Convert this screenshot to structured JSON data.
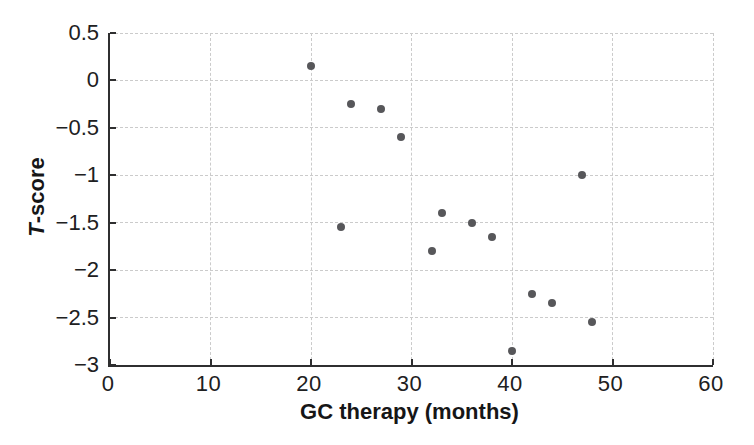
{
  "chart_data": {
    "type": "scatter",
    "title": "",
    "xlabel": "GC therapy (months)",
    "ylabel": "T-score",
    "ylabel_italic": "T",
    "ylabel_rest": "-score",
    "xlim": [
      0,
      60
    ],
    "ylim": [
      -3,
      0.5
    ],
    "grid": true,
    "gridline_style": "dashed",
    "xticks": [
      {
        "label": "0",
        "value": 0
      },
      {
        "label": "10",
        "value": 10
      },
      {
        "label": "20",
        "value": 20
      },
      {
        "label": "30",
        "value": 30
      },
      {
        "label": "40",
        "value": 40
      },
      {
        "label": "50",
        "value": 50
      },
      {
        "label": "60",
        "value": 60
      }
    ],
    "yticks": [
      {
        "label": "0.5",
        "value": 0.5
      },
      {
        "label": "0",
        "value": 0
      },
      {
        "label": "−0.5",
        "value": -0.5
      },
      {
        "label": "−1",
        "value": -1
      },
      {
        "label": "−1.5",
        "value": -1.5
      },
      {
        "label": "−2",
        "value": -2
      },
      {
        "label": "−2.5",
        "value": -2.5
      },
      {
        "label": "−3",
        "value": -3
      }
    ],
    "points": [
      [
        20,
        0.15
      ],
      [
        23,
        -1.55
      ],
      [
        24,
        -0.25
      ],
      [
        27,
        -0.3
      ],
      [
        29,
        -0.6
      ],
      [
        32,
        -1.8
      ],
      [
        33,
        -1.4
      ],
      [
        36,
        -1.5
      ],
      [
        38,
        -1.65
      ],
      [
        40,
        -2.85
      ],
      [
        42,
        -2.25
      ],
      [
        44,
        -2.35
      ],
      [
        47,
        -1.0
      ],
      [
        48,
        -2.55
      ]
    ],
    "marker": {
      "shape": "circle",
      "diameter_px": 8,
      "color": "#57575a"
    },
    "colors": {
      "axis": "#2f2f30",
      "grid": "#cbcbcb",
      "text": "#202021",
      "background": "#ffffff"
    }
  }
}
